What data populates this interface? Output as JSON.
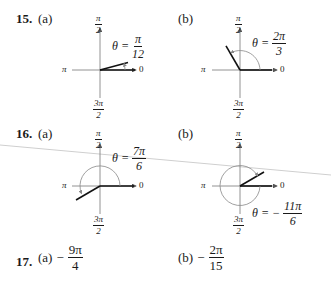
{
  "problems": [
    {
      "number": "15.",
      "parts": [
        {
          "label": "(a)",
          "theta_prefix": "θ =",
          "theta_num": "π",
          "theta_den": "12",
          "angle_rad": 0.2618
        },
        {
          "label": "(b)",
          "theta_prefix": "θ =",
          "theta_num": "2π",
          "theta_den": "3",
          "angle_rad": 2.0944
        }
      ]
    },
    {
      "number": "16.",
      "parts": [
        {
          "label": "(a)",
          "theta_prefix": "θ =",
          "theta_num": "7π",
          "theta_den": "6",
          "angle_rad": 3.6652
        },
        {
          "label": "(b)",
          "theta_prefix": "θ = −",
          "theta_num": "11π",
          "theta_den": "6",
          "angle_rad": -5.7596
        }
      ]
    },
    {
      "number": "17.",
      "parts": [
        {
          "label": "(a)",
          "sign": "−",
          "num": "9π",
          "den": "4"
        },
        {
          "label": "(b)",
          "sign": "−",
          "num": "2π",
          "den": "15"
        }
      ]
    }
  ],
  "axis_labels": {
    "top_num": "π",
    "top_den": "2",
    "left": "π",
    "right": "0",
    "bottom_num": "3π",
    "bottom_den": "2"
  }
}
